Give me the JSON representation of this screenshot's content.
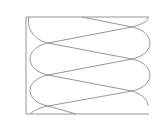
{
  "diagram": {
    "type": "looped-curve-in-frame",
    "stroke_color": "#8a8a8a",
    "frame_color": "#9a9a9a",
    "background": "#ffffff",
    "frame": {
      "x": 26,
      "y": 17,
      "width": 123,
      "height": 97
    },
    "left_crossings": [
      [
        48,
        43
      ],
      [
        48,
        75
      ],
      [
        48,
        106
      ]
    ],
    "right_crossings": [
      [
        132,
        27
      ],
      [
        132,
        59
      ],
      [
        132,
        91
      ]
    ]
  }
}
